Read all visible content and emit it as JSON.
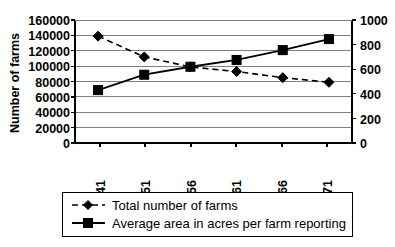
{
  "chart_data": {
    "type": "line",
    "title": "",
    "subtitle": "",
    "xlabel": "",
    "ylabel": "Number of farms",
    "y2label": "",
    "categories": [
      "1941",
      "1951",
      "1956",
      "1961",
      "1966",
      "1971"
    ],
    "grid": true,
    "legend_position": "bottom",
    "axes": {
      "left": {
        "label": "Number of farms",
        "min": 0,
        "max": 160000,
        "step": 20000,
        "ticks": [
          "0",
          "20000",
          "40000",
          "60000",
          "80000",
          "100000",
          "120000",
          "140000",
          "160000"
        ]
      },
      "right": {
        "label": "",
        "min": 0,
        "max": 1000,
        "step": 200,
        "ticks": [
          "0",
          "200",
          "400",
          "600",
          "800",
          "1000"
        ]
      }
    },
    "series": [
      {
        "name": "Total number of farms",
        "axis": "left",
        "marker": "diamond",
        "line_style": "dashed",
        "color": "#000000",
        "values": [
          139000,
          112000,
          99000,
          93000,
          85000,
          79000
        ]
      },
      {
        "name": "Average area in acres per farm reporting",
        "axis": "right",
        "marker": "square",
        "line_style": "solid",
        "color": "#000000",
        "values": [
          430,
          555,
          620,
          675,
          755,
          845
        ]
      }
    ]
  },
  "legend": {
    "entries": [
      {
        "label": "Total number of farms",
        "style": "dashed-diamond"
      },
      {
        "label": "Average area in acres per farm reporting",
        "style": "solid-square"
      }
    ]
  }
}
